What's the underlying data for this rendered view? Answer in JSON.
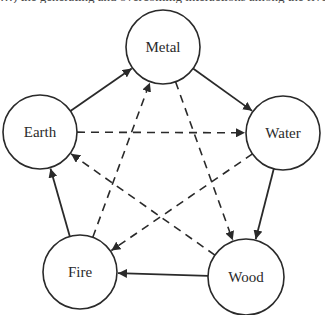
{
  "caption": "…) the generating and overcoming interactions among the five elements.",
  "colors": {
    "stroke": "#2a2a2a",
    "background": "#ffffff"
  },
  "nodes": [
    {
      "id": "metal",
      "label": "Metal",
      "cx": 163,
      "cy": 47,
      "r": 37
    },
    {
      "id": "earth",
      "label": "Earth",
      "cx": 40,
      "cy": 132,
      "r": 37
    },
    {
      "id": "water",
      "label": "Water",
      "cx": 283,
      "cy": 133,
      "r": 37
    },
    {
      "id": "fire",
      "label": "Fire",
      "cx": 80,
      "cy": 272,
      "r": 37
    },
    {
      "id": "wood",
      "label": "Wood",
      "cx": 246,
      "cy": 277,
      "r": 38
    }
  ],
  "edges": [
    {
      "from": "earth",
      "to": "metal",
      "style": "solid",
      "relation": "generates"
    },
    {
      "from": "metal",
      "to": "water",
      "style": "solid",
      "relation": "generates"
    },
    {
      "from": "water",
      "to": "wood",
      "style": "solid",
      "relation": "generates"
    },
    {
      "from": "wood",
      "to": "fire",
      "style": "solid",
      "relation": "generates"
    },
    {
      "from": "fire",
      "to": "earth",
      "style": "solid",
      "relation": "generates"
    },
    {
      "from": "earth",
      "to": "water",
      "style": "dashed",
      "relation": "overcomes"
    },
    {
      "from": "metal",
      "to": "wood",
      "style": "dashed",
      "relation": "overcomes"
    },
    {
      "from": "water",
      "to": "fire",
      "style": "dashed",
      "relation": "overcomes"
    },
    {
      "from": "fire",
      "to": "metal",
      "style": "dashed",
      "relation": "overcomes"
    },
    {
      "from": "wood",
      "to": "earth",
      "style": "dashed",
      "relation": "overcomes"
    }
  ]
}
